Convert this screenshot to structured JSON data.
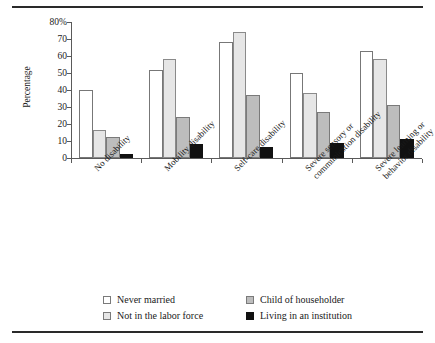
{
  "chart_data": {
    "type": "bar",
    "title": "",
    "xlabel": "",
    "ylabel": "Percentage",
    "ylim": [
      0,
      80
    ],
    "yticks": [
      0,
      10,
      20,
      30,
      40,
      50,
      60,
      70,
      80
    ],
    "ytick_labels": [
      "0",
      "10",
      "20",
      "30",
      "40",
      "50",
      "60",
      "70",
      "80%"
    ],
    "grid": false,
    "legend_position": "bottom",
    "categories": [
      "No disability",
      "Mobility disability",
      "Self-care disability",
      "Severe sensory or\ncommunication disability",
      "Severe learning or\nbehavior disability"
    ],
    "category_lines": [
      [
        "No disability"
      ],
      [
        "Mobility disability"
      ],
      [
        "Self-care disability"
      ],
      [
        "Severe sensory or",
        "communication disability"
      ],
      [
        "Severe learning or",
        "behavior disability"
      ]
    ],
    "series": [
      {
        "name": "Never married",
        "color": "#ffffff",
        "values": [
          40,
          52,
          68,
          50,
          63
        ]
      },
      {
        "name": "Not in the labor force",
        "color": "#e6e6e6",
        "values": [
          16.5,
          58,
          74,
          38,
          58
        ]
      },
      {
        "name": "Child of householder",
        "color": "#bdbdbd",
        "values": [
          12.5,
          24,
          37,
          27,
          31
        ]
      },
      {
        "name": "Living in an institution",
        "color": "#111111",
        "values": [
          2.5,
          8,
          6.5,
          9,
          11
        ]
      }
    ]
  },
  "legend": {
    "entries": [
      {
        "label": "Never married",
        "color": "#ffffff"
      },
      {
        "label": "Child of householder",
        "color": "#bdbdbd"
      },
      {
        "label": "Not in the labor force",
        "color": "#e6e6e6"
      },
      {
        "label": "Living in an institution",
        "color": "#111111"
      }
    ]
  }
}
